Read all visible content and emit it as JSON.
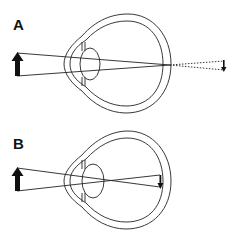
{
  "figure": {
    "panels": [
      {
        "label": "A",
        "description": "Rays from object converge at the retina; dotted extension shows image position beyond eye",
        "image_location": "behind retina (dotted projection)"
      },
      {
        "label": "B",
        "description": "Rays cross inside the eye and form an inverted image at the retina",
        "image_location": "on retina"
      }
    ],
    "colors": {
      "line": "#222222",
      "background": "#ffffff"
    }
  }
}
